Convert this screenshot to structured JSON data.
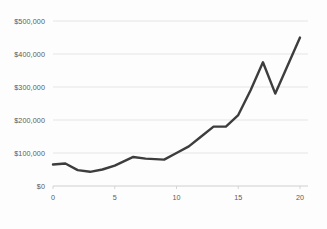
{
  "chart_data": {
    "type": "line",
    "title": "",
    "subtitle": "",
    "xlabel": "",
    "ylabel": "",
    "grid": "horizontal",
    "legend": "none",
    "xlim": [
      0,
      20.5
    ],
    "ylim": [
      0,
      500000
    ],
    "x_ticks": [
      0,
      5,
      10,
      15,
      20
    ],
    "x_tick_labels": [
      "0",
      "5",
      "10",
      "15",
      "20"
    ],
    "y_ticks": [
      0,
      100000,
      200000,
      300000,
      400000,
      500000
    ],
    "y_tick_labels": [
      "$0",
      "$100,000",
      "$200,000",
      "$300,000",
      "$400,000",
      "$500,000"
    ],
    "series": [
      {
        "name": "",
        "color": "#3d3d3d",
        "line_width": 2.4,
        "markers": "none",
        "x": [
          0,
          1,
          2,
          3,
          4,
          5,
          6.5,
          7.5,
          9,
          10,
          11,
          12,
          13,
          14,
          15,
          16,
          17,
          18,
          20
        ],
        "values": [
          65000,
          68000,
          48000,
          43000,
          50000,
          62000,
          88000,
          83000,
          80000,
          100000,
          120000,
          150000,
          180000,
          180000,
          215000,
          290000,
          375000,
          280000,
          450000
        ]
      }
    ]
  },
  "colors": {
    "line": "#3d3d3d",
    "grid": "#e2e2e2",
    "axis": "#d0d0d0",
    "tick_text": "#5a5a5a",
    "background": "#fdfdfd"
  }
}
